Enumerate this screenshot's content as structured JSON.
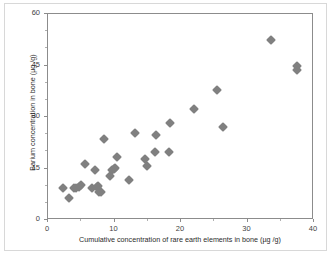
{
  "chart_data": {
    "type": "scatter",
    "title": "",
    "xlabel": "Cumulative concentration of rare earth elements in bone (µg /g)",
    "ylabel": "Barium concentration in bone  (µg /g)",
    "xlim": [
      0,
      40
    ],
    "ylim": [
      0,
      60
    ],
    "xticks": [
      0,
      10,
      20,
      30,
      40
    ],
    "yticks": [
      0,
      15,
      30,
      45,
      60
    ],
    "xtick_labels": [
      "0",
      "10",
      "20",
      "30",
      "40"
    ],
    "ytick_labels": [
      "0",
      "15",
      "30",
      "45",
      "60"
    ],
    "x_minor_interval": 5,
    "y_minor_interval": 5,
    "grid": false,
    "legend": false,
    "marker_shape": "diamond",
    "marker_color": "#808080",
    "marker_size_px": 7,
    "series": [
      {
        "name": "bone samples",
        "points": [
          [
            2.3,
            9.2
          ],
          [
            3.2,
            6.5
          ],
          [
            3.9,
            9.4
          ],
          [
            4.2,
            9.3
          ],
          [
            4.6,
            9.6
          ],
          [
            5.0,
            10.1
          ],
          [
            5.6,
            16.3
          ],
          [
            6.6,
            9.3
          ],
          [
            7.0,
            14.5
          ],
          [
            7.3,
            9.5
          ],
          [
            7.5,
            9.8
          ],
          [
            7.7,
            8.3
          ],
          [
            8.0,
            8.2
          ],
          [
            8.4,
            23.6
          ],
          [
            9.3,
            12.9
          ],
          [
            9.6,
            14.6
          ],
          [
            9.9,
            14.9
          ],
          [
            10.1,
            15.1
          ],
          [
            10.4,
            18.4
          ],
          [
            12.2,
            11.7
          ],
          [
            13.1,
            25.4
          ],
          [
            14.6,
            17.9
          ],
          [
            14.9,
            15.7
          ],
          [
            16.1,
            19.9
          ],
          [
            16.3,
            24.7
          ],
          [
            18.2,
            19.9
          ],
          [
            18.3,
            28.3
          ],
          [
            22.0,
            32.3
          ],
          [
            25.4,
            38.0
          ],
          [
            26.3,
            27.2
          ],
          [
            33.6,
            52.5
          ],
          [
            37.4,
            43.6
          ],
          [
            37.5,
            44.8
          ]
        ]
      }
    ]
  },
  "axes": {
    "y_title": "Barium concentration in bone  (µg /g)",
    "x_title": "Cumulative concentration of rare earth elements in bone (µg /g)"
  }
}
